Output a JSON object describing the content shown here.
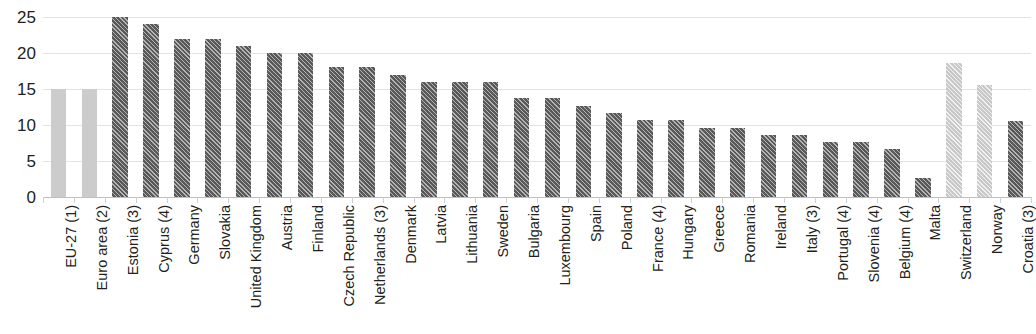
{
  "chart_data": {
    "type": "bar",
    "title": "",
    "subtitle": "",
    "xlabel": "",
    "ylabel": "",
    "ylim": [
      0,
      25
    ],
    "yticks": [
      0,
      5,
      10,
      15,
      20,
      25
    ],
    "grid": true,
    "legend": "none",
    "orientation": "vertical",
    "categories": [
      "EU-27 (1)",
      "Euro area (2)",
      "Estonia (3)",
      "Cyprus (4)",
      "Germany",
      "Slovakia",
      "United Kingdom",
      "Austria",
      "Finland",
      "Czech Republic",
      "Netherlands (3)",
      "Denmark",
      "Latvia",
      "Lithuania",
      "Sweden",
      "Bulgaria",
      "Luxembourg",
      "Spain",
      "Poland",
      "France (4)",
      "Hungary",
      "Greece",
      "Romania",
      "Ireland",
      "Italy (3)",
      "Portugal (4)",
      "Slovenia (4)",
      "Belgium (4)",
      "Malta",
      "Switzerland",
      "Norway",
      "Croatia (3)"
    ],
    "values": [
      15.0,
      15.0,
      25.0,
      24.0,
      22.0,
      22.0,
      21.0,
      20.0,
      20.0,
      18.0,
      18.0,
      17.0,
      16.0,
      16.0,
      16.0,
      13.7,
      13.7,
      12.6,
      11.6,
      10.7,
      10.7,
      9.6,
      9.6,
      8.6,
      8.6,
      7.7,
      7.7,
      6.6,
      2.6,
      18.6,
      15.6,
      10.6
    ],
    "styles": [
      "solid-light",
      "solid-light",
      "hatch-dark",
      "hatch-dark",
      "hatch-dark",
      "hatch-dark",
      "hatch-dark",
      "hatch-dark",
      "hatch-dark",
      "hatch-dark",
      "hatch-dark",
      "hatch-dark",
      "hatch-dark",
      "hatch-dark",
      "hatch-dark",
      "hatch-dark",
      "hatch-dark",
      "hatch-dark",
      "hatch-dark",
      "hatch-dark",
      "hatch-dark",
      "hatch-dark",
      "hatch-dark",
      "hatch-dark",
      "hatch-dark",
      "hatch-dark",
      "hatch-dark",
      "hatch-dark",
      "hatch-dark",
      "hatch-light",
      "hatch-light",
      "hatch-dark"
    ],
    "colors": {
      "aggregate_bar": "#cccccc",
      "member_bar": "#595959",
      "noneu_bar": "#c9c9c9",
      "gridline": "#e3e3e3",
      "axis": "#bfbfbf",
      "text": "#231f20",
      "background": "#ffffff"
    }
  }
}
